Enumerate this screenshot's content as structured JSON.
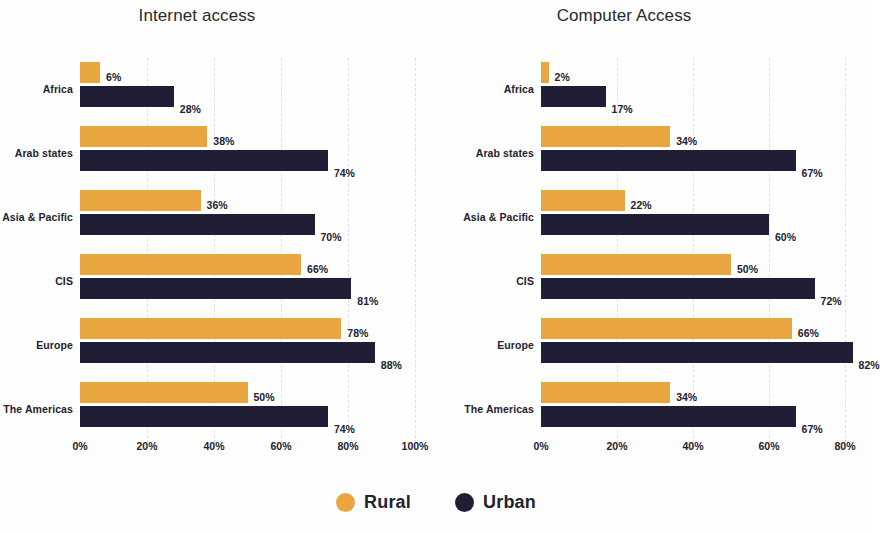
{
  "legend": {
    "position": "bottom-center",
    "items": [
      {
        "label": "Rural",
        "color": "#e9a53f",
        "marker": "circle"
      },
      {
        "label": "Urban",
        "color": "#201e35",
        "marker": "circle"
      }
    ]
  },
  "colors": {
    "rural": "#e9a53f",
    "urban": "#201e35",
    "text": "#23222f",
    "gridline": "#dfe1e8",
    "background": "#fefefe"
  },
  "chart_data": [
    {
      "type": "bar",
      "orientation": "horizontal",
      "title": "Internet access",
      "xlabel": "",
      "ylabel": "",
      "xlim": [
        0,
        100
      ],
      "xticks": [
        "0%",
        "20%",
        "40%",
        "60%",
        "80%",
        "100%"
      ],
      "xtick_values": [
        0,
        20,
        40,
        60,
        80,
        100
      ],
      "grid": true,
      "value_suffix": "%",
      "categories": [
        "Africa",
        "Arab states",
        "Asia & Pacific",
        "CIS",
        "Europe",
        "The Americas"
      ],
      "series": [
        {
          "name": "Rural",
          "color": "#e9a53f",
          "values": [
            6,
            38,
            36,
            66,
            78,
            50
          ],
          "labels": [
            "6%",
            "38%",
            "36%",
            "66%",
            "78%",
            "50%"
          ]
        },
        {
          "name": "Urban",
          "color": "#201e35",
          "values": [
            28,
            74,
            70,
            81,
            88,
            74
          ],
          "labels": [
            "28%",
            "74%",
            "70%",
            "81%",
            "88%",
            "74%"
          ]
        }
      ]
    },
    {
      "type": "bar",
      "orientation": "horizontal",
      "title": "Computer Access",
      "xlabel": "",
      "ylabel": "",
      "xlim": [
        0,
        80
      ],
      "xticks": [
        "0%",
        "20%",
        "40%",
        "60%",
        "80%"
      ],
      "xtick_values": [
        0,
        20,
        40,
        60,
        80
      ],
      "grid": true,
      "value_suffix": "%",
      "categories": [
        "Africa",
        "Arab states",
        "Asia & Pacific",
        "CIS",
        "Europe",
        "The Americas"
      ],
      "series": [
        {
          "name": "Rural",
          "color": "#e9a53f",
          "values": [
            2,
            34,
            22,
            50,
            66,
            34
          ],
          "labels": [
            "2%",
            "34%",
            "22%",
            "50%",
            "66%",
            "34%"
          ]
        },
        {
          "name": "Urban",
          "color": "#201e35",
          "values": [
            17,
            67,
            60,
            72,
            82,
            67
          ],
          "labels": [
            "17%",
            "67%",
            "60%",
            "72%",
            "82%",
            "67%"
          ]
        }
      ]
    }
  ]
}
